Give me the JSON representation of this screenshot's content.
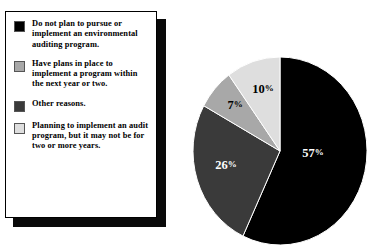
{
  "chart_data": {
    "type": "pie",
    "title": "",
    "categories": [
      "Do not plan to pursue or implement an environmental auditing program.",
      "Other reasons.",
      "Have plans in place to implement a program within the next year or two.",
      "Planning to implement an audit program, but it may not be for two or more years."
    ],
    "values": [
      57,
      26,
      7,
      10
    ],
    "labels": [
      "57%",
      "26%",
      "7%",
      "10%"
    ],
    "colors": [
      "#000000",
      "#3a3a3a",
      "#a8a8a8",
      "#dedede"
    ],
    "legend_position": "left",
    "grid": false,
    "start_angle_deg": 0,
    "direction": "clockwise"
  },
  "legend": {
    "items": [
      {
        "swatch_color": "#000000",
        "label": "Do not plan to pursue or implement an environmental auditing program.",
        "value": 57
      },
      {
        "swatch_color": "#a8a8a8",
        "label": "Have plans in place to implement a program within the next year or two.",
        "value": 7
      },
      {
        "swatch_color": "#3a3a3a",
        "label": "Other reasons.",
        "value": 26
      },
      {
        "swatch_color": "#dedede",
        "label": "Planning to implement an audit program, but it may not be for two or more years.",
        "value": 10
      }
    ]
  },
  "pie": {
    "slices": [
      {
        "name": "do-not-plan",
        "percent": 57,
        "label_number": "57",
        "label_sign": "%",
        "color": "#000000",
        "text_color": "#ffffff",
        "label_x": 120,
        "label_y": 100
      },
      {
        "name": "other-reasons",
        "percent": 26,
        "label_number": "26",
        "label_sign": "%",
        "color": "#3a3a3a",
        "text_color": "#ffffff",
        "label_x": 33,
        "label_y": 112
      },
      {
        "name": "plans-in-place",
        "percent": 7,
        "label_number": "7",
        "label_sign": "%",
        "color": "#a8a8a8",
        "text_color": "#000000",
        "label_x": 42,
        "label_y": 52
      },
      {
        "name": "planning-two-or-more-years",
        "percent": 10,
        "label_number": "10",
        "label_sign": "%",
        "color": "#dedede",
        "text_color": "#000000",
        "label_x": 70,
        "label_y": 36
      }
    ]
  }
}
